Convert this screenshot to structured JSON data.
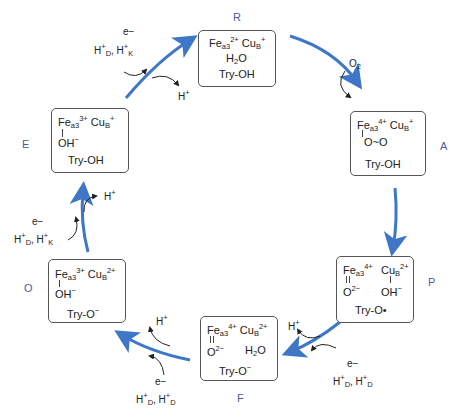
{
  "diagram": {
    "type": "catalytic-cycle",
    "accent_color": "#3f77c8",
    "states": {
      "R": {
        "label": "R",
        "fe": "Fe",
        "fe_sub": "a3",
        "fe_sup": "2+",
        "cu": "Cu",
        "cu_sub": "B",
        "cu_sup": "+",
        "line2": "H",
        "line2_sub": "2",
        "line2_tail": "O",
        "tyr": "Try-OH"
      },
      "A": {
        "label": "A",
        "fe": "Fe",
        "fe_sub": "a3",
        "fe_sup": "4+",
        "cu": "Cu",
        "cu_sub": "B",
        "cu_sup": "+",
        "ligand": "O~O",
        "tyr": "Try-OH"
      },
      "P": {
        "label": "P",
        "fe": "Fe",
        "fe_sub": "a3",
        "fe_sup": "4+",
        "cu": "Cu",
        "cu_sub": "B",
        "cu_sup": "2+",
        "fe_ligand": "O",
        "fe_ligand_sup": "2−",
        "cu_ligand": "OH",
        "cu_ligand_sup": "−",
        "tyr": "Try-O•"
      },
      "F": {
        "label": "F",
        "fe": "Fe",
        "fe_sub": "a3",
        "fe_sup": "4+",
        "cu": "Cu",
        "cu_sub": "B",
        "cu_sup": "2+",
        "fe_ligand": "O",
        "fe_ligand_sup": "2−",
        "water": "H",
        "water_sub": "2",
        "water_tail": "O",
        "tyr": "Try-O",
        "tyr_sup": "−"
      },
      "O": {
        "label": "O",
        "fe": "Fe",
        "fe_sub": "a3",
        "fe_sup": "3+",
        "cu": "Cu",
        "cu_sub": "B",
        "cu_sup": "2+",
        "fe_ligand": "OH",
        "fe_ligand_sup": "−",
        "tyr": "Try-O",
        "tyr_sup": "−"
      },
      "E": {
        "label": "E",
        "fe": "Fe",
        "fe_sub": "a3",
        "fe_sup": "3+",
        "cu": "Cu",
        "cu_sub": "B",
        "cu_sup": "+",
        "fe_ligand": "OH",
        "fe_ligand_sup": "−",
        "tyr": "Try-OH"
      }
    },
    "annotations": {
      "E_to_R_in_e": "e−",
      "E_to_R_in_h": "H",
      "E_to_R_in_h_sup": "+",
      "E_to_R_in_h_sub": "D",
      "E_to_R_in_h2": "H",
      "E_to_R_in_h2_sup": "+",
      "E_to_R_in_h2_sub": "K",
      "E_to_R_out": "H",
      "E_to_R_out_sup": "+",
      "R_to_A_in": "O",
      "R_to_A_in_sub": "2",
      "P_to_F_out": "H",
      "P_to_F_out_sup": "+",
      "P_to_F_in_e": "e−",
      "P_to_F_in_h": "H",
      "P_to_F_in_h_sup": "+",
      "P_to_F_in_h_sub": "D",
      "P_to_F_in_h2": "H",
      "P_to_F_in_h2_sup": "+",
      "P_to_F_in_h2_sub": "D",
      "F_to_O_out": "H",
      "F_to_O_out_sup": "+",
      "F_to_O_in_e": "e−",
      "F_to_O_in_h": "H",
      "F_to_O_in_h_sup": "+",
      "F_to_O_in_h_sub": "D",
      "F_to_O_in_h2": "H",
      "F_to_O_in_h2_sup": "+",
      "F_to_O_in_h2_sub": "D",
      "O_to_E_out": "H",
      "O_to_E_out_sup": "+",
      "O_to_E_in_e": "e−",
      "O_to_E_in_h": "H",
      "O_to_E_in_h_sup": "+",
      "O_to_E_in_h_sub": "D",
      "O_to_E_in_h2": "H",
      "O_to_E_in_h2_sup": "+",
      "O_to_E_in_h2_sub": "K"
    },
    "transitions": [
      {
        "from": "R",
        "to": "A"
      },
      {
        "from": "A",
        "to": "P"
      },
      {
        "from": "P",
        "to": "F"
      },
      {
        "from": "F",
        "to": "O"
      },
      {
        "from": "O",
        "to": "E"
      },
      {
        "from": "E",
        "to": "R"
      }
    ]
  }
}
